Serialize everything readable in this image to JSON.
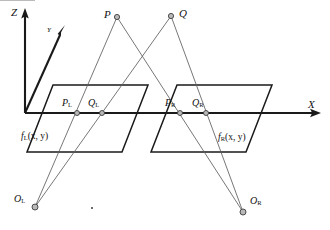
{
  "figure": {
    "background_color": "#ffffff",
    "axis_color": "#1a1a1a",
    "ray_color": "#5e5e5e",
    "node_fill_color": "#b9b9b9",
    "node_stroke_color": "#3d3d3d",
    "plane_edge_color": "#1a1a1a"
  },
  "axes": [
    {
      "name": "z-axis",
      "label": "Z",
      "label_x": 11,
      "label_y": 7,
      "from_x": 25,
      "from_y": 113,
      "to_x": 25,
      "to_y": 12
    },
    {
      "name": "y-axis",
      "label": "Y",
      "label_x": 47,
      "label_y": 27,
      "from_x": 25,
      "from_y": 113,
      "to_x": 64,
      "to_y": 31
    },
    {
      "name": "x-axis",
      "label": "X",
      "label_x": 308,
      "label_y": 99,
      "from_x": 25,
      "from_y": 113,
      "to_x": 320,
      "to_y": 113
    }
  ],
  "planes": [
    {
      "name": "left-image-plane",
      "label": "f",
      "label_sub": "L",
      "label_args": "(x, y)",
      "label_x": 21,
      "label_y": 132,
      "points": "53,85 148,85 122,152 27,152"
    },
    {
      "name": "right-image-plane",
      "label": "f",
      "label_sub": "R",
      "label_args": "(x, y)",
      "label_x": 218,
      "label_y": 133,
      "points": "177,85 272,85 246,152 151,152"
    }
  ],
  "points": [
    {
      "name": "point-p",
      "label": "P",
      "sub": "",
      "cx": 117,
      "cy": 17,
      "label_x": 104,
      "label_y": 9,
      "r": 2.6
    },
    {
      "name": "point-q",
      "label": "Q",
      "sub": "",
      "cx": 171,
      "cy": 16,
      "label_x": 179,
      "label_y": 8,
      "r": 2.6
    },
    {
      "name": "projection-pl",
      "label": "P",
      "sub": "L",
      "cx": 77,
      "cy": 113,
      "label_x": 62,
      "label_y": 98,
      "r": 2.5
    },
    {
      "name": "projection-ql",
      "label": "Q",
      "sub": "L",
      "cx": 102,
      "cy": 113,
      "label_x": 88,
      "label_y": 98,
      "r": 2.5
    },
    {
      "name": "projection-pr",
      "label": "P",
      "sub": "R",
      "cx": 180,
      "cy": 113,
      "label_x": 165,
      "label_y": 98,
      "r": 2.5
    },
    {
      "name": "projection-qr",
      "label": "Q",
      "sub": "R",
      "cx": 206,
      "cy": 113,
      "label_x": 192,
      "label_y": 98,
      "r": 2.5
    },
    {
      "name": "camera-center-ol",
      "label": "O",
      "sub": "L",
      "cx": 35,
      "cy": 207,
      "label_x": 14,
      "label_y": 194,
      "r": 3.0
    },
    {
      "name": "camera-center-or",
      "label": "O",
      "sub": "R",
      "cx": 243,
      "cy": 212,
      "label_x": 250,
      "label_y": 196,
      "r": 3.0
    }
  ],
  "rays": [
    {
      "name": "ray-ol-to-p",
      "x1": 35,
      "y1": 207,
      "x2": 117,
      "y2": 17
    },
    {
      "name": "ray-ol-to-q",
      "x1": 35,
      "y1": 207,
      "x2": 171,
      "y2": 16
    },
    {
      "name": "ray-or-to-p",
      "x1": 243,
      "y1": 212,
      "x2": 117,
      "y2": 17
    },
    {
      "name": "ray-or-to-q",
      "x1": 243,
      "y1": 212,
      "x2": 171,
      "y2": 16
    }
  ],
  "speck": {
    "name": "stray-mark",
    "x": 91,
    "y": 207
  }
}
